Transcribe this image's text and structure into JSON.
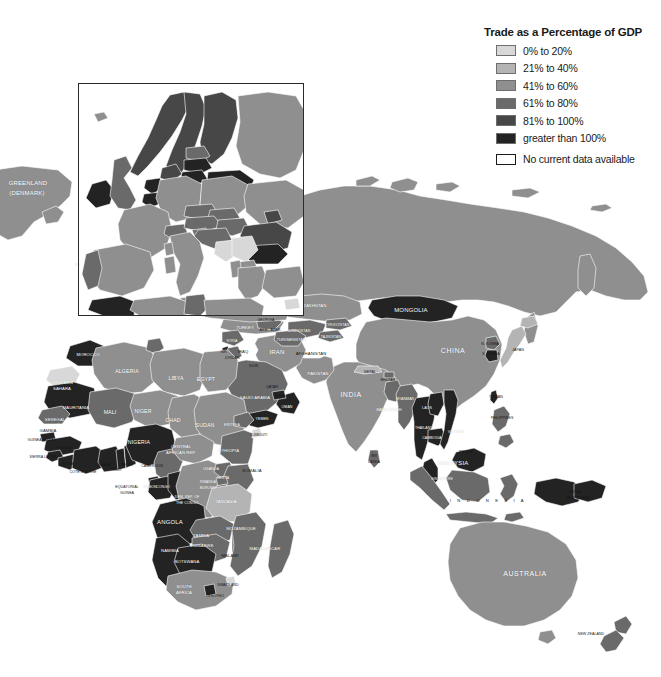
{
  "legend": {
    "title": "Trade as a Percentage of GDP",
    "items": [
      {
        "label": "0% to 20%",
        "color": "#d8d8d8"
      },
      {
        "label": "21% to 40%",
        "color": "#b4b4b4"
      },
      {
        "label": "41% to 60%",
        "color": "#8f8f8f"
      },
      {
        "label": "61% to 80%",
        "color": "#6a6a6a"
      },
      {
        "label": "81% to 100%",
        "color": "#474747"
      },
      {
        "label": "greater than 100%",
        "color": "#232323"
      },
      {
        "label": "No current data available",
        "color": "#ffffff"
      }
    ]
  },
  "map": {
    "background": "#ffffff",
    "border_color": "#ffffff",
    "inset": {
      "name": "europe-inset",
      "border_color": "#2b2b2b"
    },
    "labels": {
      "greenland": "GREENLAND\n(DENMARK)",
      "greenland_l1": "GREENLAND",
      "greenland_l2": "(DENMARK)"
    }
  },
  "inset_labels": [
    {
      "name": "sweden",
      "text": "SWEDEN",
      "x": 143,
      "y": 121,
      "cls": "ilbl"
    },
    {
      "name": "finland",
      "text": "FINLAND",
      "x": 180,
      "y": 132,
      "cls": "ilbl"
    },
    {
      "name": "norway",
      "text": "NORWAY",
      "x": 122,
      "y": 143,
      "cls": "ilbl"
    },
    {
      "name": "latvia",
      "text": "LATVIA",
      "x": 196,
      "y": 166,
      "cls": "ilbl sm"
    },
    {
      "name": "lithuania",
      "text": "LITH.",
      "x": 193,
      "y": 176,
      "cls": "ilbl sm"
    },
    {
      "name": "belarus",
      "text": "BELARUS",
      "x": 231,
      "y": 182,
      "cls": "ilbl sm"
    },
    {
      "name": "netherlands",
      "text": "NETH.",
      "x": 151,
      "y": 187,
      "cls": "ilbl sm"
    },
    {
      "name": "germany",
      "text": "GERMANY",
      "x": 181,
      "y": 192,
      "cls": "ilbl"
    },
    {
      "name": "poland",
      "text": "POLAND",
      "x": 222,
      "y": 194,
      "cls": "ilbl"
    },
    {
      "name": "united-kingdom",
      "text": "UNITED",
      "x": 128,
      "y": 191,
      "cls": "ilbl sm"
    },
    {
      "name": "united-kingdom2",
      "text": "KINGDOM",
      "x": 128,
      "y": 197,
      "cls": "ilbl sm"
    },
    {
      "name": "ireland",
      "text": "IRELAND",
      "x": 103,
      "y": 192,
      "cls": "ilbl xs"
    },
    {
      "name": "ukraine",
      "text": "UKRAINE",
      "x": 266,
      "y": 204,
      "cls": "ilbl sm"
    },
    {
      "name": "belgium",
      "text": "BELG.",
      "x": 152,
      "y": 204,
      "cls": "ilbl xs"
    },
    {
      "name": "czech",
      "text": "CZECH",
      "x": 199,
      "y": 209,
      "cls": "ilbl xs"
    },
    {
      "name": "slovakia",
      "text": "SLOVAKIA",
      "x": 216,
      "y": 213,
      "cls": "ilbl xs"
    },
    {
      "name": "austria",
      "text": "AUSTRIA",
      "x": 204,
      "y": 226,
      "cls": "ilbl sm"
    },
    {
      "name": "hungary",
      "text": "HUNG.",
      "x": 231,
      "y": 226,
      "cls": "ilbl sm"
    },
    {
      "name": "france",
      "text": "FRANCE",
      "x": 143,
      "y": 231,
      "cls": "ilbl"
    },
    {
      "name": "switzerland",
      "text": "SWITZ.",
      "x": 174,
      "y": 232,
      "cls": "ilbl sm"
    },
    {
      "name": "romania",
      "text": "ROMANIA",
      "x": 263,
      "y": 232,
      "cls": "ilbl"
    },
    {
      "name": "croatia",
      "text": "CROATIA",
      "x": 214,
      "y": 235,
      "cls": "ilbl sm"
    },
    {
      "name": "italy",
      "text": "ITALY",
      "x": 184,
      "y": 241,
      "cls": "ilbl"
    },
    {
      "name": "yugoslavia",
      "text": "YUGO.",
      "x": 240,
      "y": 246,
      "cls": "ilbl xs"
    },
    {
      "name": "bulgaria",
      "text": "BULG.",
      "x": 264,
      "y": 251,
      "cls": "ilbl sm"
    },
    {
      "name": "bosnia",
      "text": "BOSN.",
      "x": 235,
      "y": 257,
      "cls": "ilbl xs"
    },
    {
      "name": "spain",
      "text": "SPAIN",
      "x": 118,
      "y": 268,
      "cls": "ilbl"
    },
    {
      "name": "portugal",
      "text": "PORTUGAL",
      "x": 88,
      "y": 264,
      "cls": "ilbl xs"
    },
    {
      "name": "greece",
      "text": "GREECE",
      "x": 254,
      "y": 279,
      "cls": "ilbl xs"
    },
    {
      "name": "albania",
      "text": "ALB.",
      "x": 238,
      "y": 270,
      "cls": "ilbl xs"
    },
    {
      "name": "macedonia",
      "text": "MACED.",
      "x": 249,
      "y": 265,
      "cls": "ilbl xs"
    },
    {
      "name": "tunisia",
      "text": "TUNISIA",
      "x": 193,
      "y": 303,
      "cls": "ilbl sm"
    },
    {
      "name": "cyprus",
      "text": "CYP.",
      "x": 292,
      "y": 307,
      "cls": "ilbl xs"
    },
    {
      "name": "moldova",
      "text": "MOLD.",
      "x": 272,
      "y": 219,
      "cls": "ilbl xs"
    },
    {
      "name": "slovenia",
      "text": "SLOV.",
      "x": 200,
      "y": 236,
      "cls": "ilbl xs"
    },
    {
      "name": "estonia",
      "text": "EST.",
      "x": 196,
      "y": 154,
      "cls": "ilbl xs"
    },
    {
      "name": "denmark",
      "text": "DEN.",
      "x": 170,
      "y": 176,
      "cls": "ilbl xs"
    },
    {
      "name": "luxembourg",
      "text": "LUX.",
      "x": 160,
      "y": 210,
      "cls": "ilbl xs"
    }
  ],
  "world_labels": [
    {
      "name": "greenland",
      "text": "GREENLAND",
      "x": 28,
      "y": 183,
      "cls": "lbl mid"
    },
    {
      "name": "greenland-2",
      "text": "(DENMARK)",
      "x": 27,
      "y": 193,
      "cls": "lbl mid"
    },
    {
      "name": "morocco",
      "text": "MOROCCO",
      "x": 88,
      "y": 354,
      "cls": "lbl tiny"
    },
    {
      "name": "algeria",
      "text": "ALGERIA",
      "x": 127,
      "y": 371,
      "cls": "lbl"
    },
    {
      "name": "libya",
      "text": "LIBYA",
      "x": 176,
      "y": 378,
      "cls": "lbl"
    },
    {
      "name": "egypt",
      "text": "EGYPT",
      "x": 206,
      "y": 379,
      "cls": "lbl"
    },
    {
      "name": "western-sahara",
      "text": "WESTERN",
      "x": 62,
      "y": 382,
      "cls": "lbl tiny"
    },
    {
      "name": "western-sahara2",
      "text": "SAHARA",
      "x": 62,
      "y": 388,
      "cls": "lbl tiny"
    },
    {
      "name": "mauritania",
      "text": "MAURITANIA",
      "x": 76,
      "y": 407,
      "cls": "lbl tiny"
    },
    {
      "name": "mali",
      "text": "MALI",
      "x": 110,
      "y": 412,
      "cls": "lbl"
    },
    {
      "name": "niger",
      "text": "NIGER",
      "x": 143,
      "y": 411,
      "cls": "lbl"
    },
    {
      "name": "chad",
      "text": "CHAD",
      "x": 173,
      "y": 420,
      "cls": "lbl"
    },
    {
      "name": "sudan",
      "text": "SUDAN",
      "x": 205,
      "y": 425,
      "cls": "lbl"
    },
    {
      "name": "senegal",
      "text": "SENEGAL",
      "x": 55,
      "y": 419,
      "cls": "lbl tiny"
    },
    {
      "name": "gambia",
      "text": "GAMBIA",
      "x": 48,
      "y": 430,
      "cls": "lbl tiny dk"
    },
    {
      "name": "guinea-bissau",
      "text": "GUINEA-BISSAU",
      "x": 42,
      "y": 440,
      "cls": "lbl xtiny dk"
    },
    {
      "name": "guinea",
      "text": "GUINEA",
      "x": 64,
      "y": 448,
      "cls": "lbl xtiny dk"
    },
    {
      "name": "sierra-leone",
      "text": "SIERRA LEONE",
      "x": 43,
      "y": 457,
      "cls": "lbl xtiny dk"
    },
    {
      "name": "liberia",
      "text": "LIBERIA",
      "x": 67,
      "y": 464,
      "cls": "lbl xtiny dk"
    },
    {
      "name": "cote-divoire",
      "text": "COTE D'IVOIRE",
      "x": 83,
      "y": 472,
      "cls": "lbl xtiny dk"
    },
    {
      "name": "ghana",
      "text": "GHANA",
      "x": 104,
      "y": 465,
      "cls": "lbl xtiny dk"
    },
    {
      "name": "togo",
      "text": "TOGO",
      "x": 116,
      "y": 470,
      "cls": "lbl xtiny dk"
    },
    {
      "name": "benin",
      "text": "BENIN",
      "x": 127,
      "y": 465,
      "cls": "lbl xtiny dk"
    },
    {
      "name": "nigeria",
      "text": "NIGERIA",
      "x": 139,
      "y": 442,
      "cls": "lbl"
    },
    {
      "name": "cameroon",
      "text": "CAMEROON",
      "x": 152,
      "y": 466,
      "cls": "lbl xtiny dk"
    },
    {
      "name": "car",
      "text": "CENTRAL",
      "x": 181,
      "y": 446,
      "cls": "lbl tiny"
    },
    {
      "name": "car2",
      "text": "AFRICAN REP.",
      "x": 181,
      "y": 452,
      "cls": "lbl tiny"
    },
    {
      "name": "equatorial-guinea",
      "text": "EQUATORIAL",
      "x": 127,
      "y": 487,
      "cls": "lbl xtiny dk"
    },
    {
      "name": "equatorial-guinea2",
      "text": "GUINEA",
      "x": 127,
      "y": 493,
      "cls": "lbl xtiny dk"
    },
    {
      "name": "gabon",
      "text": "GABON",
      "x": 150,
      "y": 487,
      "cls": "lbl xtiny"
    },
    {
      "name": "congo",
      "text": "CONGO",
      "x": 163,
      "y": 487,
      "cls": "lbl xtiny"
    },
    {
      "name": "drc",
      "text": "DEM. REP. OF",
      "x": 187,
      "y": 497,
      "cls": "lbl xtiny"
    },
    {
      "name": "drc2",
      "text": "THE CONGO",
      "x": 187,
      "y": 503,
      "cls": "lbl xtiny"
    },
    {
      "name": "uganda",
      "text": "UGANDA",
      "x": 211,
      "y": 469,
      "cls": "lbl xtiny"
    },
    {
      "name": "rwanda",
      "text": "RWANDA",
      "x": 208,
      "y": 482,
      "cls": "lbl xtiny"
    },
    {
      "name": "burundi",
      "text": "BURUNDI",
      "x": 208,
      "y": 488,
      "cls": "lbl xtiny"
    },
    {
      "name": "kenya",
      "text": "KENYA",
      "x": 223,
      "y": 478,
      "cls": "lbl xtiny"
    },
    {
      "name": "ethiopia",
      "text": "ETHIOPIA",
      "x": 229,
      "y": 450,
      "cls": "lbl tiny"
    },
    {
      "name": "eritrea",
      "text": "ERITREA",
      "x": 232,
      "y": 425,
      "cls": "lbl xtiny"
    },
    {
      "name": "djibouti",
      "text": "DJIBOUTI",
      "x": 259,
      "y": 435,
      "cls": "lbl xtiny dk"
    },
    {
      "name": "somalia",
      "text": "SOMALIA",
      "x": 252,
      "y": 470,
      "cls": "lbl tiny dk"
    },
    {
      "name": "tanzania",
      "text": "TANZANIA",
      "x": 226,
      "y": 501,
      "cls": "lbl tiny"
    },
    {
      "name": "angola",
      "text": "ANGOLA",
      "x": 170,
      "y": 522,
      "cls": "lbl mid"
    },
    {
      "name": "zambia",
      "text": "ZAMBIA",
      "x": 201,
      "y": 535,
      "cls": "lbl tiny"
    },
    {
      "name": "malawi",
      "text": "MALAWI",
      "x": 230,
      "y": 555,
      "cls": "lbl tiny dk"
    },
    {
      "name": "mozambique",
      "text": "MOZAMBIQUE",
      "x": 241,
      "y": 528,
      "cls": "lbl tiny"
    },
    {
      "name": "madagascar",
      "text": "MADAGASCAR",
      "x": 265,
      "y": 548,
      "cls": "lbl tiny"
    },
    {
      "name": "zimbabwe",
      "text": "ZIMBABWE",
      "x": 202,
      "y": 545,
      "cls": "lbl tiny"
    },
    {
      "name": "namibia",
      "text": "NAMIBIA",
      "x": 170,
      "y": 550,
      "cls": "lbl tiny"
    },
    {
      "name": "botswana",
      "text": "BOTSWANA",
      "x": 187,
      "y": 561,
      "cls": "lbl tiny"
    },
    {
      "name": "south-africa",
      "text": "SOUTH",
      "x": 184,
      "y": 586,
      "cls": "lbl tiny"
    },
    {
      "name": "south-africa2",
      "text": "AFRICA",
      "x": 184,
      "y": 592,
      "cls": "lbl tiny"
    },
    {
      "name": "swaziland",
      "text": "SWAZILAND",
      "x": 228,
      "y": 585,
      "cls": "lbl xtiny dk"
    },
    {
      "name": "lesotho",
      "text": "LESOTHO",
      "x": 215,
      "y": 596,
      "cls": "lbl xtiny dk"
    },
    {
      "name": "turkey",
      "text": "TURKEY",
      "x": 245,
      "y": 327,
      "cls": "lbl tiny"
    },
    {
      "name": "syria",
      "text": "SYRIA",
      "x": 232,
      "y": 341,
      "cls": "lbl xtiny"
    },
    {
      "name": "iraq",
      "text": "IRAQ",
      "x": 243,
      "y": 351,
      "cls": "lbl tiny dk"
    },
    {
      "name": "iran",
      "text": "IRAN",
      "x": 277,
      "y": 352,
      "cls": "lbl mid"
    },
    {
      "name": "afghanistan",
      "text": "AFGHANISTAN",
      "x": 311,
      "y": 353,
      "cls": "lbl tiny dk"
    },
    {
      "name": "pakistan",
      "text": "PAKISTAN",
      "x": 318,
      "y": 373,
      "cls": "lbl tiny"
    },
    {
      "name": "saudi-arabia",
      "text": "SAUDI ARABIA",
      "x": 255,
      "y": 397,
      "cls": "lbl tiny"
    },
    {
      "name": "yemen",
      "text": "YEMEN",
      "x": 262,
      "y": 419,
      "cls": "lbl xtiny"
    },
    {
      "name": "oman",
      "text": "OMAN",
      "x": 287,
      "y": 407,
      "cls": "lbl xtiny"
    },
    {
      "name": "india",
      "text": "INDIA",
      "x": 351,
      "y": 394,
      "cls": "lbl big"
    },
    {
      "name": "nepal",
      "text": "NEPAL",
      "x": 370,
      "y": 372,
      "cls": "lbl xtiny dk"
    },
    {
      "name": "bangladesh",
      "text": "BANGLADESH",
      "x": 389,
      "y": 410,
      "cls": "lbl xtiny"
    },
    {
      "name": "sri-lanka",
      "text": "SRI",
      "x": 374,
      "y": 456,
      "cls": "lbl xtiny dk"
    },
    {
      "name": "sri-lanka2",
      "text": "LANKA",
      "x": 374,
      "y": 462,
      "cls": "lbl xtiny dk"
    },
    {
      "name": "kazakhstan",
      "text": "KAZAKHSTAN",
      "x": 312,
      "y": 305,
      "cls": "lbl tiny"
    },
    {
      "name": "mongolia",
      "text": "MONGOLIA",
      "x": 411,
      "y": 310,
      "cls": "lbl mid"
    },
    {
      "name": "china",
      "text": "CHINA",
      "x": 453,
      "y": 350,
      "cls": "lbl big"
    },
    {
      "name": "japan",
      "text": "JAPAN",
      "x": 518,
      "y": 350,
      "cls": "lbl xtiny dk"
    },
    {
      "name": "north-korea",
      "text": "N. KOREA",
      "x": 490,
      "y": 344,
      "cls": "lbl xtiny dk"
    },
    {
      "name": "south-korea",
      "text": "S. KOREA",
      "x": 491,
      "y": 354,
      "cls": "lbl xtiny dk"
    },
    {
      "name": "taiwan",
      "text": "TAIWAN",
      "x": 496,
      "y": 397,
      "cls": "lbl xtiny dk"
    },
    {
      "name": "myanmar",
      "text": "MYANMAR",
      "x": 405,
      "y": 399,
      "cls": "lbl xtiny"
    },
    {
      "name": "laos",
      "text": "LAOS",
      "x": 427,
      "y": 408,
      "cls": "lbl xtiny"
    },
    {
      "name": "thailand",
      "text": "THAILAND",
      "x": 424,
      "y": 428,
      "cls": "lbl xtiny"
    },
    {
      "name": "cambodia",
      "text": "CAMBODIA",
      "x": 432,
      "y": 438,
      "cls": "lbl xtiny"
    },
    {
      "name": "vietnam",
      "text": "VIETNAM",
      "x": 456,
      "y": 432,
      "cls": "lbl xtiny"
    },
    {
      "name": "philippines",
      "text": "PHILIPPINES",
      "x": 502,
      "y": 418,
      "cls": "lbl xtiny dk"
    },
    {
      "name": "malaysia",
      "text": "MALAYSIA",
      "x": 453,
      "y": 463,
      "cls": "lbl mid"
    },
    {
      "name": "brunei",
      "text": "BRUNEI",
      "x": 466,
      "y": 452,
      "cls": "lbl xtiny dk"
    },
    {
      "name": "singapore",
      "text": "SINGAPORE",
      "x": 442,
      "y": 479,
      "cls": "lbl xtiny"
    },
    {
      "name": "indonesia",
      "text": "I N D O N E S I A",
      "x": 488,
      "y": 500,
      "cls": "lbl tiny dk wide"
    },
    {
      "name": "papua-new-guinea",
      "text": "PAPUA",
      "x": 575,
      "y": 492,
      "cls": "lbl xtiny dk"
    },
    {
      "name": "papua-new-guinea2",
      "text": "NEW GUINEA",
      "x": 578,
      "y": 498,
      "cls": "lbl xtiny dk"
    },
    {
      "name": "australia",
      "text": "AUSTRALIA",
      "x": 525,
      "y": 573,
      "cls": "lbl big"
    },
    {
      "name": "new-zealand",
      "text": "NEW ZEALAND",
      "x": 591,
      "y": 634,
      "cls": "lbl xtiny dk"
    },
    {
      "name": "uzbekistan",
      "text": "UZBEKISTAN",
      "x": 299,
      "y": 331,
      "cls": "lbl xtiny"
    },
    {
      "name": "turkmenistan",
      "text": "TURKMENISTAN",
      "x": 291,
      "y": 340,
      "cls": "lbl xtiny"
    },
    {
      "name": "kyrgyzstan",
      "text": "KYRGYZSTAN",
      "x": 337,
      "y": 325,
      "cls": "lbl xtiny"
    },
    {
      "name": "tajikistan",
      "text": "TAJIKISTAN",
      "x": 331,
      "y": 337,
      "cls": "lbl xtiny"
    },
    {
      "name": "georgia",
      "text": "GEORGIA",
      "x": 266,
      "y": 320,
      "cls": "lbl xtiny dk"
    },
    {
      "name": "armenia",
      "text": "ARM.",
      "x": 264,
      "y": 330,
      "cls": "lbl xtiny dk"
    },
    {
      "name": "azerbaijan",
      "text": "AZER.",
      "x": 276,
      "y": 330,
      "cls": "lbl xtiny dk"
    },
    {
      "name": "israel",
      "text": "ISR.",
      "x": 224,
      "y": 352,
      "cls": "lbl xtiny dk"
    },
    {
      "name": "jordan",
      "text": "JORDAN",
      "x": 232,
      "y": 358,
      "cls": "lbl xtiny dk"
    },
    {
      "name": "kuwait",
      "text": "KUW.",
      "x": 254,
      "y": 366,
      "cls": "lbl xtiny dk"
    },
    {
      "name": "uae",
      "text": "U.A.E.",
      "x": 280,
      "y": 396,
      "cls": "lbl xtiny dk"
    },
    {
      "name": "qatar",
      "text": "QATAR",
      "x": 272,
      "y": 387,
      "cls": "lbl xtiny dk"
    },
    {
      "name": "bhutan",
      "text": "BHUTAN",
      "x": 388,
      "y": 380,
      "cls": "lbl xtiny dk"
    }
  ]
}
